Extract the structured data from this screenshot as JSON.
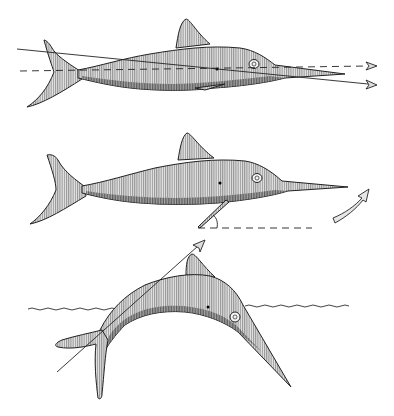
{
  "figure": {
    "title": "",
    "colors": {
      "ink": "#222222",
      "background": "#ffffff",
      "hatch": "#555555"
    },
    "panels": [
      {
        "id": "horizontal-swim",
        "features": [
          "body axis dashed line with arrow",
          "inclined thrust line with arrow",
          "eye",
          "center-of-mass dot"
        ]
      },
      {
        "id": "pectoral-fin-angle",
        "features": [
          "pectoral fin angled below body",
          "dashed horizontal reference",
          "angle arc",
          "curved upward arrow"
        ]
      },
      {
        "id": "leap",
        "features": [
          "arched fish breaking water surface",
          "wavy water line",
          "diagonal trajectory arrow"
        ]
      }
    ]
  }
}
